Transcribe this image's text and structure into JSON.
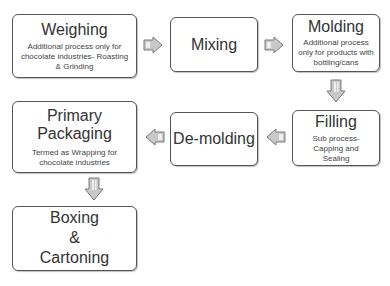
{
  "diagram": {
    "type": "process-flowchart",
    "steps": [
      {
        "id": "weighing",
        "title": "Weighing",
        "note": "Additional process only for chocolate industries- Roasting & Grinding"
      },
      {
        "id": "mixing",
        "title": "Mixing",
        "note": ""
      },
      {
        "id": "molding",
        "title": "Molding",
        "note": "Additional process only for products with bottling/cans"
      },
      {
        "id": "filling",
        "title": "Filling",
        "note": "Sub process- Capping and Sealing"
      },
      {
        "id": "demolding",
        "title": "De-molding",
        "note": ""
      },
      {
        "id": "primary_packaging",
        "title": "Primary Packaging",
        "note": "Termed as Wrapping for chocolate industries"
      },
      {
        "id": "boxing",
        "title_lines": [
          "Boxing",
          "&",
          "Cartoning"
        ],
        "note": ""
      }
    ],
    "flow": [
      {
        "from": "weighing",
        "to": "mixing",
        "direction": "right"
      },
      {
        "from": "mixing",
        "to": "molding",
        "direction": "right"
      },
      {
        "from": "molding",
        "to": "filling",
        "direction": "down"
      },
      {
        "from": "filling",
        "to": "demolding",
        "direction": "left"
      },
      {
        "from": "demolding",
        "to": "primary_packaging",
        "direction": "left"
      },
      {
        "from": "primary_packaging",
        "to": "boxing",
        "direction": "down"
      }
    ],
    "colors": {
      "box_border": "#555555",
      "arrow_fill": "#c8c8c8",
      "arrow_stroke": "#7a7a7a",
      "text": "#333333"
    }
  }
}
